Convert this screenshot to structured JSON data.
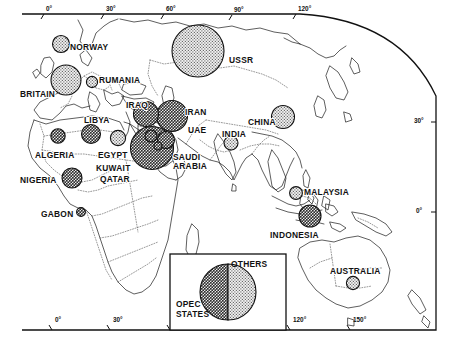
{
  "figure": {
    "type": "proportional-symbol-map",
    "projection_note": "world map, Europe–Africa–Asia–Australia",
    "frame": {
      "top_axis_labels": [
        "0°",
        "30°",
        "60°",
        "90°",
        "120°"
      ],
      "bottom_axis_labels": [
        "0°",
        "30°",
        "120°",
        "150°"
      ],
      "right_axis_labels": [
        "30°",
        "0°"
      ]
    }
  },
  "symbols": {
    "opec_fill": "#8a8a8a",
    "other_fill": "#d2d2d2",
    "stroke": "#111111"
  },
  "countries": [
    {
      "name": "NORWAY",
      "group": "others",
      "r": 8.5,
      "cx": 61,
      "cy": 44,
      "lx": 70,
      "ly": 43,
      "anchor": "left"
    },
    {
      "name": "BRITAIN",
      "group": "others",
      "r": 15.0,
      "cx": 66,
      "cy": 80,
      "lx": 20,
      "ly": 90,
      "anchor": "left"
    },
    {
      "name": "RUMANIA",
      "group": "others",
      "r": 5.6,
      "cx": 92,
      "cy": 82,
      "lx": 99,
      "ly": 76,
      "anchor": "left"
    },
    {
      "name": "USSR",
      "group": "others",
      "r": 26.0,
      "cx": 198,
      "cy": 51,
      "lx": 229,
      "ly": 56,
      "anchor": "left"
    },
    {
      "name": "LIBYA",
      "group": "opec",
      "r": 9.5,
      "cx": 91,
      "cy": 134,
      "lx": 84,
      "ly": 116,
      "anchor": "left"
    },
    {
      "name": "ALGERIA",
      "group": "opec",
      "r": 7.2,
      "cx": 58,
      "cy": 136,
      "lx": 35,
      "ly": 151,
      "anchor": "left"
    },
    {
      "name": "EGYPT",
      "group": "others",
      "r": 7.6,
      "cx": 118,
      "cy": 138,
      "lx": 98,
      "ly": 151,
      "anchor": "left"
    },
    {
      "name": "NIGERIA",
      "group": "opec",
      "r": 10.0,
      "cx": 72,
      "cy": 178,
      "lx": 20,
      "ly": 176,
      "anchor": "left"
    },
    {
      "name": "GABON",
      "group": "opec",
      "r": 4.4,
      "cx": 81,
      "cy": 212,
      "lx": 41,
      "ly": 210,
      "anchor": "left"
    },
    {
      "name": "IRAQ",
      "group": "opec",
      "r": 12.5,
      "cx": 146,
      "cy": 114,
      "lx": 126,
      "ly": 101,
      "anchor": "left"
    },
    {
      "name": "IRAN",
      "group": "opec",
      "r": 15.5,
      "cx": 172,
      "cy": 116,
      "lx": 185,
      "ly": 108,
      "anchor": "left"
    },
    {
      "name": "UAE",
      "group": "opec",
      "r": 8.5,
      "cx": 166,
      "cy": 140,
      "lx": 188,
      "ly": 126,
      "anchor": "left"
    },
    {
      "name": "SAUDI ARABIA",
      "group": "opec",
      "r": 21.5,
      "cx": 152,
      "cy": 148,
      "lx": 173,
      "ly": 153,
      "anchor": "left"
    },
    {
      "name": "KUWAIT",
      "group": "opec",
      "r": 6.0,
      "cx": 151,
      "cy": 136,
      "lx": 96,
      "ly": 164,
      "anchor": "left"
    },
    {
      "name": "QATAR",
      "group": "opec",
      "r": 4.0,
      "cx": 158,
      "cy": 146,
      "lx": 100,
      "ly": 175,
      "anchor": "left"
    },
    {
      "name": "INDIA",
      "group": "others",
      "r": 7.0,
      "cx": 231,
      "cy": 143,
      "lx": 222,
      "ly": 130,
      "anchor": "left"
    },
    {
      "name": "CHINA",
      "group": "others",
      "r": 11.5,
      "cx": 283,
      "cy": 117,
      "lx": 248,
      "ly": 118,
      "anchor": "left"
    },
    {
      "name": "MALAYSIA",
      "group": "others",
      "r": 6.4,
      "cx": 296,
      "cy": 193,
      "lx": 304,
      "ly": 188,
      "anchor": "left"
    },
    {
      "name": "INDONESIA",
      "group": "opec",
      "r": 11.0,
      "cx": 310,
      "cy": 216,
      "lx": 270,
      "ly": 231,
      "anchor": "left"
    },
    {
      "name": "AUSTRALIA",
      "group": "others",
      "r": 6.6,
      "cx": 353,
      "cy": 283,
      "lx": 330,
      "ly": 267,
      "anchor": "left"
    }
  ],
  "legend": {
    "opec_label": "OPEC\nSTATES",
    "others_label": "OTHERS",
    "opec_share": 50,
    "others_share": 50
  },
  "chart_data": {
    "type": "pie",
    "title": "",
    "categories": [
      "OPEC STATES",
      "OTHERS"
    ],
    "values": [
      50,
      50
    ],
    "legend_position": "inset-bottom-center"
  }
}
